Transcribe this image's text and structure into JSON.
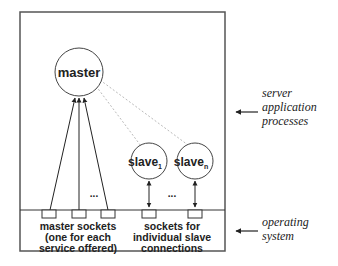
{
  "diagram": {
    "nodes": {
      "master": {
        "label": "master"
      },
      "slave_1": {
        "label": "slave",
        "subscript": "1"
      },
      "slave_n": {
        "label": "slave",
        "subscript": "n"
      }
    },
    "ellipsis": "...",
    "socket_labels": {
      "master_sockets": [
        "master sockets",
        "(one for each",
        "service offered)"
      ],
      "slave_sockets": [
        "sockets for",
        "individual slave",
        "connections"
      ]
    },
    "layer_labels": {
      "server_processes": [
        "server",
        "application",
        "processes"
      ],
      "operating_system": [
        "operating",
        "system"
      ]
    },
    "colors": {
      "line": "#222222",
      "dotted": "#bbbbbb",
      "background": "#ffffff"
    }
  }
}
